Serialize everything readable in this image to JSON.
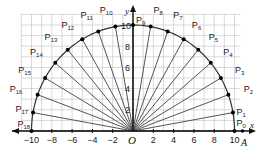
{
  "diagram": {
    "type": "semicircle-radial-points",
    "origin_label": "O",
    "x_axis_label": "x",
    "y_axis_label": "y",
    "point_A_label": "A",
    "radius": 10,
    "x_ticks": [
      -10,
      -8,
      -6,
      -4,
      -2,
      2,
      4,
      6,
      8,
      10
    ],
    "y_ticks": [
      2,
      4,
      6,
      8,
      10
    ],
    "x_range": [
      -11,
      10.5
    ],
    "y_range": [
      0,
      11
    ],
    "angle_step_deg": 10,
    "points": [
      {
        "label": "P",
        "sub": "0",
        "angle": 0
      },
      {
        "label": "P",
        "sub": "1",
        "angle": 10
      },
      {
        "label": "P",
        "sub": "2",
        "angle": 20
      },
      {
        "label": "P",
        "sub": "3",
        "angle": 30
      },
      {
        "label": "P",
        "sub": "4",
        "angle": 40
      },
      {
        "label": "P",
        "sub": "5",
        "angle": 50
      },
      {
        "label": "P",
        "sub": "6",
        "angle": 60
      },
      {
        "label": "P",
        "sub": "7",
        "angle": 70
      },
      {
        "label": "P",
        "sub": "8",
        "angle": 80
      },
      {
        "label": "P",
        "sub": "9",
        "angle": 90
      },
      {
        "label": "P",
        "sub": "10",
        "angle": 100
      },
      {
        "label": "P",
        "sub": "11",
        "angle": 110
      },
      {
        "label": "P",
        "sub": "12",
        "angle": 120
      },
      {
        "label": "P",
        "sub": "13",
        "angle": 130
      },
      {
        "label": "P",
        "sub": "14",
        "angle": 140
      },
      {
        "label": "P",
        "sub": "15",
        "angle": 150
      },
      {
        "label": "P",
        "sub": "16",
        "angle": 160
      },
      {
        "label": "P",
        "sub": "17",
        "angle": 170
      },
      {
        "label": "P",
        "sub": "18",
        "angle": 180
      }
    ],
    "colors": {
      "grid": "#bfbfbf",
      "axis": "#111111",
      "ray": "#555555",
      "arc": "#333333",
      "point": "#000000"
    }
  }
}
